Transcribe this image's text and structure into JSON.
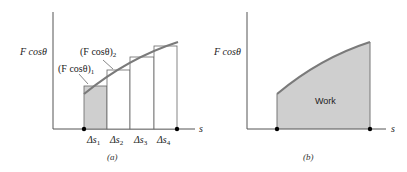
{
  "diagram_a": {
    "y_axis_label": "F cosθ",
    "x_axis_label": "s",
    "label_bar1": "(F cosθ)",
    "label_bar1_sub": "1",
    "label_bar2": "(F cosθ)",
    "label_bar2_sub": "2",
    "intervals": [
      {
        "label": "Δs",
        "sub": "1"
      },
      {
        "label": "Δs",
        "sub": "2"
      },
      {
        "label": "Δs",
        "sub": "3"
      },
      {
        "label": "Δs",
        "sub": "4"
      }
    ],
    "caption": "(a)"
  },
  "diagram_b": {
    "y_axis_label": "F cosθ",
    "x_axis_label": "s",
    "area_label": "Work",
    "caption": "(b)"
  },
  "colors": {
    "curve": "#7a7a7a",
    "fill": "#cfcfcf",
    "axis": "#555555",
    "dot": "#000000"
  }
}
